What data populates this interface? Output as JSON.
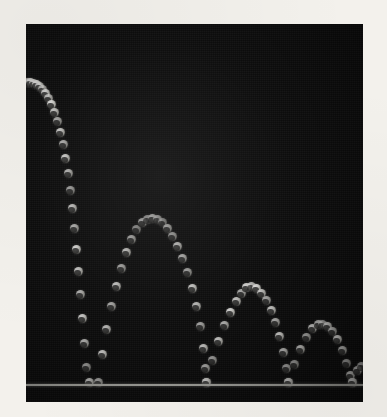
{
  "figure": {
    "kind": "stroboscopic-photograph",
    "caption": "",
    "frame": {
      "photo_left": 26,
      "photo_top": 24,
      "photo_width": 337,
      "photo_height": 378,
      "border_color": "#f3f1ec",
      "background_color": "#0c0c0c"
    },
    "floor": {
      "name": "floor-line",
      "y": 360,
      "color": "#cfcfc8"
    },
    "ball": {
      "color": "#ffffff",
      "shadow_color": "#0d0d0c",
      "diameter_px": 9
    }
  },
  "chart_data": {
    "type": "scatter",
    "subtitle": "Successive flash images of a ball released at upper left",
    "xlabel": "Horizontal position",
    "ylabel": "Height above floor",
    "xlim": [
      0,
      337
    ],
    "ylim": [
      0,
      378
    ],
    "grid": false,
    "legend": false,
    "annotations": [
      "Equal time intervals between flashes",
      "Horizontal spacing increases left to right",
      "Bounce height decreases with each impact"
    ],
    "y_axis_inverted_pixels": true,
    "bounce_points": [
      {
        "index": 1,
        "x": 72,
        "y": 358
      },
      {
        "index": 2,
        "x": 180,
        "y": 358
      },
      {
        "index": 3,
        "x": 262,
        "y": 358
      },
      {
        "index": 4,
        "x": 326,
        "y": 358
      }
    ],
    "arc_peaks": [
      {
        "index": 1,
        "x": 126,
        "y": 194
      },
      {
        "index": 2,
        "x": 220,
        "y": 263
      },
      {
        "index": 3,
        "x": 296,
        "y": 300
      }
    ],
    "series": [
      {
        "name": "ball-positions",
        "marker": "circle",
        "color": "#ffffff",
        "points": [
          [
            1,
            58
          ],
          [
            4,
            58
          ],
          [
            7,
            59
          ],
          [
            10,
            60
          ],
          [
            13,
            62
          ],
          [
            16,
            65
          ],
          [
            19,
            69
          ],
          [
            22,
            74
          ],
          [
            25,
            80
          ],
          [
            28,
            88
          ],
          [
            31,
            97
          ],
          [
            34,
            108
          ],
          [
            37,
            120
          ],
          [
            39,
            134
          ],
          [
            42,
            149
          ],
          [
            44,
            166
          ],
          [
            46,
            184
          ],
          [
            48,
            204
          ],
          [
            50,
            225
          ],
          [
            52,
            247
          ],
          [
            54,
            270
          ],
          [
            56,
            294
          ],
          [
            58,
            319
          ],
          [
            60,
            343
          ],
          [
            63,
            358
          ],
          [
            72,
            358
          ],
          [
            76,
            330
          ],
          [
            80,
            305
          ],
          [
            85,
            282
          ],
          [
            90,
            262
          ],
          [
            95,
            244
          ],
          [
            100,
            228
          ],
          [
            105,
            215
          ],
          [
            110,
            205
          ],
          [
            116,
            198
          ],
          [
            121,
            195
          ],
          [
            126,
            194
          ],
          [
            131,
            195
          ],
          [
            136,
            198
          ],
          [
            141,
            204
          ],
          [
            146,
            212
          ],
          [
            151,
            222
          ],
          [
            156,
            234
          ],
          [
            161,
            248
          ],
          [
            166,
            264
          ],
          [
            170,
            282
          ],
          [
            174,
            302
          ],
          [
            177,
            324
          ],
          [
            179,
            344
          ],
          [
            180,
            358
          ],
          [
            180,
            358
          ],
          [
            186,
            336
          ],
          [
            192,
            317
          ],
          [
            198,
            301
          ],
          [
            204,
            288
          ],
          [
            210,
            277
          ],
          [
            215,
            269
          ],
          [
            220,
            263
          ],
          [
            225,
            262
          ],
          [
            230,
            264
          ],
          [
            235,
            269
          ],
          [
            240,
            276
          ],
          [
            245,
            286
          ],
          [
            249,
            298
          ],
          [
            253,
            312
          ],
          [
            257,
            328
          ],
          [
            260,
            344
          ],
          [
            262,
            358
          ],
          [
            262,
            358
          ],
          [
            268,
            340
          ],
          [
            274,
            325
          ],
          [
            280,
            313
          ],
          [
            286,
            304
          ],
          [
            292,
            300
          ],
          [
            296,
            300
          ],
          [
            301,
            302
          ],
          [
            306,
            307
          ],
          [
            311,
            315
          ],
          [
            316,
            326
          ],
          [
            320,
            339
          ],
          [
            324,
            351
          ],
          [
            326,
            358
          ],
          [
            326,
            358
          ],
          [
            331,
            346
          ],
          [
            335,
            342
          ]
        ]
      }
    ]
  }
}
